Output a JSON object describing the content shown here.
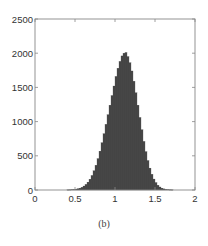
{
  "caption": "(b)",
  "chart_data": {
    "type": "bar",
    "subtype": "histogram",
    "title": "",
    "xlabel": "",
    "ylabel": "",
    "xlim": [
      0,
      2
    ],
    "ylim": [
      0,
      2500
    ],
    "xticks": [
      0,
      0.5,
      1,
      1.5,
      2
    ],
    "xtick_labels": [
      "0",
      "0.5",
      "1",
      "1.5",
      "2"
    ],
    "yticks": [
      0,
      500,
      1000,
      1500,
      2000,
      2500
    ],
    "ytick_labels": [
      "0",
      "500",
      "1000",
      "1500",
      "2000",
      "2500"
    ],
    "grid": false,
    "box": true,
    "bar_color": "#4a4a4a",
    "distribution_hint": {
      "shape": "approximately normal",
      "center": 1.07,
      "std": 0.17,
      "peak_count": 2000
    },
    "bin_width": 0.025,
    "bin_centers": [
      0.4125,
      0.4375,
      0.4625,
      0.4875,
      0.5125,
      0.5375,
      0.5625,
      0.5875,
      0.6125,
      0.6375,
      0.6625,
      0.6875,
      0.7125,
      0.7375,
      0.7625,
      0.7875,
      0.8125,
      0.8375,
      0.8625,
      0.8875,
      0.9125,
      0.9375,
      0.9625,
      0.9875,
      1.0125,
      1.0375,
      1.0625,
      1.0875,
      1.1125,
      1.1375,
      1.1625,
      1.1875,
      1.2125,
      1.2375,
      1.2625,
      1.2875,
      1.3125,
      1.3375,
      1.3625,
      1.3875,
      1.4125,
      1.4375,
      1.4625,
      1.4875,
      1.5125,
      1.5375,
      1.5625,
      1.5875,
      1.6125,
      1.6375,
      1.6625,
      1.6875,
      1.7125
    ],
    "values": [
      2,
      3,
      5,
      8,
      12,
      18,
      27,
      40,
      58,
      82,
      115,
      158,
      212,
      280,
      362,
      458,
      568,
      690,
      822,
      960,
      1100,
      1240,
      1380,
      1520,
      1660,
      1780,
      1880,
      1960,
      2000,
      2010,
      1950,
      1860,
      1740,
      1590,
      1420,
      1240,
      1060,
      880,
      710,
      560,
      430,
      320,
      230,
      160,
      108,
      70,
      44,
      27,
      16,
      9,
      5,
      3,
      2
    ]
  }
}
